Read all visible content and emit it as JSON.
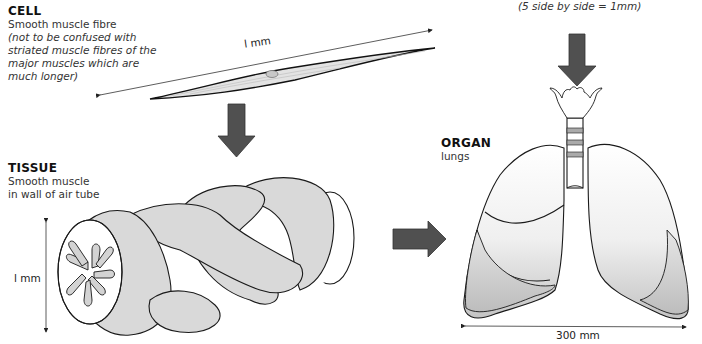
{
  "cell": {
    "heading": "CELL",
    "subtitle": "Smooth muscle fibre",
    "note_lines": [
      "(not to be confused with",
      "striated muscle fibres of the",
      "major muscles which are",
      "much longer)"
    ],
    "scale_label": "l mm"
  },
  "top_note": "(5 side by side = 1mm)",
  "tissue": {
    "heading": "TISSUE",
    "subtitle_lines": [
      "Smooth muscle",
      "in wall of air tube"
    ],
    "scale_label": "l mm"
  },
  "organ": {
    "heading": "ORGAN",
    "subtitle": "lungs",
    "scale_label": "300 mm"
  },
  "colors": {
    "arrow_fill": "#505050",
    "outline": "#1a1a1a",
    "muscle_fill": "#d9d9d9",
    "lung_light": "#f4f4f4",
    "lung_shade": "#c8c8c8"
  }
}
